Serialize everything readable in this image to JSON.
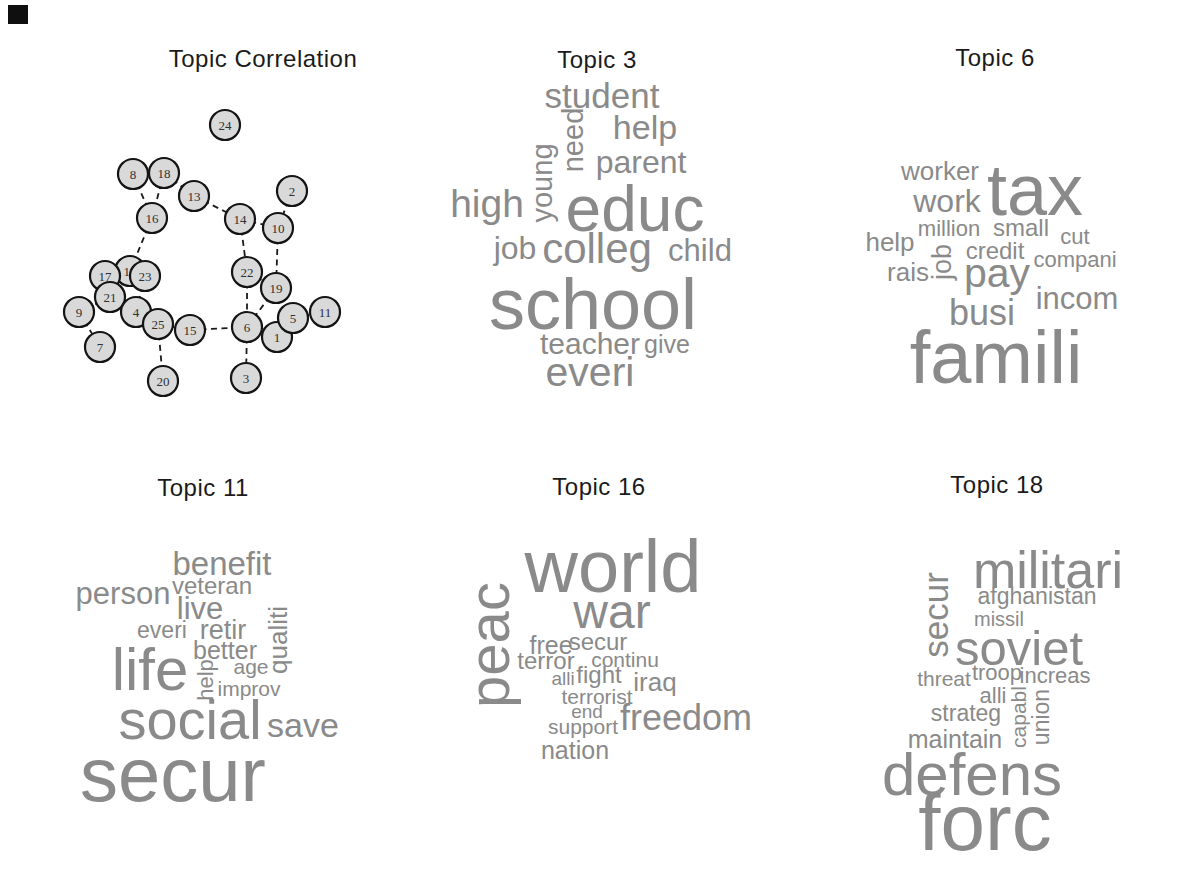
{
  "colors": {
    "background": "#ffffff",
    "word": "#8a8a8a",
    "title": "#1b1b1b",
    "node_fill": "#d9d9d9",
    "node_stroke": "#141414",
    "node_label": "#303030",
    "edge": "#1a1a1a",
    "corner_mark": "#0f0f0f"
  },
  "artifact": {
    "corner_mark_visible": true
  },
  "chart_data": [
    {
      "type": "scatter",
      "subtype": "network-graph",
      "title": "Topic Correlation",
      "title_x": 263,
      "title_y": 59,
      "legend_position": "none",
      "grid": false,
      "nodes": [
        {
          "id": "24",
          "x": 225,
          "y": 125
        },
        {
          "id": "8",
          "x": 133,
          "y": 174
        },
        {
          "id": "18",
          "x": 164,
          "y": 173
        },
        {
          "id": "13",
          "x": 194,
          "y": 196
        },
        {
          "id": "2",
          "x": 292,
          "y": 191
        },
        {
          "id": "16",
          "x": 152,
          "y": 218
        },
        {
          "id": "14",
          "x": 240,
          "y": 219
        },
        {
          "id": "10",
          "x": 278,
          "y": 228
        },
        {
          "id": "9",
          "x": 79,
          "y": 312
        },
        {
          "id": "12",
          "x": 130,
          "y": 271
        },
        {
          "id": "17",
          "x": 105,
          "y": 276
        },
        {
          "id": "23",
          "x": 145,
          "y": 276
        },
        {
          "id": "21",
          "x": 110,
          "y": 297
        },
        {
          "id": "4",
          "x": 136,
          "y": 312
        },
        {
          "id": "7",
          "x": 100,
          "y": 347
        },
        {
          "id": "15",
          "x": 190,
          "y": 330
        },
        {
          "id": "25",
          "x": 158,
          "y": 324
        },
        {
          "id": "20",
          "x": 163,
          "y": 381
        },
        {
          "id": "22",
          "x": 247,
          "y": 272
        },
        {
          "id": "19",
          "x": 276,
          "y": 288
        },
        {
          "id": "1",
          "x": 277,
          "y": 337
        },
        {
          "id": "6",
          "x": 247,
          "y": 327
        },
        {
          "id": "5",
          "x": 293,
          "y": 318
        },
        {
          "id": "11",
          "x": 325,
          "y": 312
        },
        {
          "id": "3",
          "x": 246,
          "y": 378
        }
      ],
      "edges": [
        [
          "8",
          "16"
        ],
        [
          "18",
          "16"
        ],
        [
          "8",
          "18"
        ],
        [
          "18",
          "13"
        ],
        [
          "13",
          "14"
        ],
        [
          "14",
          "10"
        ],
        [
          "2",
          "10"
        ],
        [
          "14",
          "22"
        ],
        [
          "10",
          "19"
        ],
        [
          "22",
          "19"
        ],
        [
          "22",
          "6"
        ],
        [
          "19",
          "6"
        ],
        [
          "15",
          "6"
        ],
        [
          "6",
          "3"
        ],
        [
          "6",
          "1"
        ],
        [
          "5",
          "1"
        ],
        [
          "5",
          "11"
        ],
        [
          "16",
          "12"
        ],
        [
          "12",
          "23"
        ],
        [
          "12",
          "17"
        ],
        [
          "17",
          "21"
        ],
        [
          "21",
          "9"
        ],
        [
          "9",
          "7"
        ],
        [
          "21",
          "4"
        ],
        [
          "4",
          "23"
        ],
        [
          "4",
          "25"
        ],
        [
          "25",
          "15"
        ],
        [
          "25",
          "20"
        ]
      ]
    },
    {
      "type": "scatter",
      "subtype": "wordcloud",
      "title": "Topic 3",
      "title_x": 597,
      "title_y": 60,
      "words": [
        {
          "t": "student",
          "x": 602,
          "y": 95,
          "s": 35,
          "r": 0
        },
        {
          "t": "need",
          "x": 573,
          "y": 140,
          "s": 29,
          "r": 90
        },
        {
          "t": "help",
          "x": 645,
          "y": 127,
          "s": 34,
          "r": 0
        },
        {
          "t": "young",
          "x": 542,
          "y": 183,
          "s": 29,
          "r": 90
        },
        {
          "t": "parent",
          "x": 641,
          "y": 162,
          "s": 32,
          "r": 0
        },
        {
          "t": "high",
          "x": 487,
          "y": 203,
          "s": 39,
          "r": 0
        },
        {
          "t": "educ",
          "x": 635,
          "y": 209,
          "s": 64,
          "r": 0
        },
        {
          "t": "job",
          "x": 515,
          "y": 248,
          "s": 32,
          "r": 0
        },
        {
          "t": "colleg",
          "x": 597,
          "y": 249,
          "s": 42,
          "r": 0
        },
        {
          "t": "child",
          "x": 700,
          "y": 250,
          "s": 31,
          "r": 0
        },
        {
          "t": "school",
          "x": 593,
          "y": 304,
          "s": 72,
          "r": 0
        },
        {
          "t": "teacher",
          "x": 590,
          "y": 344,
          "s": 30,
          "r": 0
        },
        {
          "t": "give",
          "x": 667,
          "y": 344,
          "s": 25,
          "r": 0
        },
        {
          "t": "everi",
          "x": 590,
          "y": 372,
          "s": 41,
          "r": 0
        }
      ]
    },
    {
      "type": "scatter",
      "subtype": "wordcloud",
      "title": "Topic 6",
      "title_x": 995,
      "title_y": 58,
      "words": [
        {
          "t": "worker",
          "x": 940,
          "y": 171,
          "s": 26,
          "r": 0
        },
        {
          "t": "tax",
          "x": 1035,
          "y": 190,
          "s": 72,
          "r": 0
        },
        {
          "t": "work",
          "x": 947,
          "y": 201,
          "s": 32,
          "r": 0
        },
        {
          "t": "million",
          "x": 949,
          "y": 229,
          "s": 22,
          "r": 0
        },
        {
          "t": "small",
          "x": 1021,
          "y": 228,
          "s": 24,
          "r": 0
        },
        {
          "t": "cut",
          "x": 1075,
          "y": 237,
          "s": 22,
          "r": 0
        },
        {
          "t": "help",
          "x": 890,
          "y": 242,
          "s": 26,
          "r": 0
        },
        {
          "t": "credit",
          "x": 995,
          "y": 251,
          "s": 24,
          "r": 0
        },
        {
          "t": "job",
          "x": 942,
          "y": 262,
          "s": 27,
          "r": 90
        },
        {
          "t": "compani",
          "x": 1075,
          "y": 260,
          "s": 22,
          "r": 0
        },
        {
          "t": "rais",
          "x": 908,
          "y": 272,
          "s": 26,
          "r": 0
        },
        {
          "t": "pay",
          "x": 997,
          "y": 273,
          "s": 41,
          "r": 0
        },
        {
          "t": "incom",
          "x": 1077,
          "y": 298,
          "s": 31,
          "r": 0
        },
        {
          "t": "busi",
          "x": 982,
          "y": 313,
          "s": 36,
          "r": 0
        },
        {
          "t": "famili",
          "x": 996,
          "y": 358,
          "s": 74,
          "r": 0
        }
      ]
    },
    {
      "type": "scatter",
      "subtype": "wordcloud",
      "title": "Topic 11",
      "title_x": 203,
      "title_y": 488,
      "words": [
        {
          "t": "benefit",
          "x": 222,
          "y": 563,
          "s": 33,
          "r": 0
        },
        {
          "t": "person",
          "x": 123,
          "y": 593,
          "s": 31,
          "r": 0
        },
        {
          "t": "veteran",
          "x": 212,
          "y": 586,
          "s": 24,
          "r": 0
        },
        {
          "t": "live",
          "x": 200,
          "y": 608,
          "s": 31,
          "r": 0
        },
        {
          "t": "everi",
          "x": 162,
          "y": 630,
          "s": 23,
          "r": 0
        },
        {
          "t": "retir",
          "x": 223,
          "y": 630,
          "s": 27,
          "r": 0
        },
        {
          "t": "qualiti",
          "x": 278,
          "y": 640,
          "s": 26,
          "r": 90
        },
        {
          "t": "better",
          "x": 225,
          "y": 650,
          "s": 25,
          "r": 0
        },
        {
          "t": "age",
          "x": 251,
          "y": 666,
          "s": 21,
          "r": 0
        },
        {
          "t": "life",
          "x": 150,
          "y": 670,
          "s": 60,
          "r": 0
        },
        {
          "t": "help",
          "x": 206,
          "y": 680,
          "s": 22,
          "r": 90
        },
        {
          "t": "improv",
          "x": 249,
          "y": 688,
          "s": 21,
          "r": 0
        },
        {
          "t": "social",
          "x": 190,
          "y": 720,
          "s": 56,
          "r": 0
        },
        {
          "t": "save",
          "x": 303,
          "y": 725,
          "s": 34,
          "r": 0
        },
        {
          "t": "secur",
          "x": 173,
          "y": 775,
          "s": 76,
          "r": 0
        }
      ]
    },
    {
      "type": "scatter",
      "subtype": "wordcloud",
      "title": "Topic 16",
      "title_x": 599,
      "title_y": 487,
      "words": [
        {
          "t": "world",
          "x": 613,
          "y": 567,
          "s": 74,
          "r": 0
        },
        {
          "t": "peac",
          "x": 489,
          "y": 645,
          "s": 58,
          "r": 90
        },
        {
          "t": "war",
          "x": 612,
          "y": 612,
          "s": 48,
          "r": 0
        },
        {
          "t": "free",
          "x": 551,
          "y": 645,
          "s": 25,
          "r": 0
        },
        {
          "t": "secur",
          "x": 598,
          "y": 642,
          "s": 24,
          "r": 0
        },
        {
          "t": "terror",
          "x": 546,
          "y": 661,
          "s": 24,
          "r": 0
        },
        {
          "t": "continu",
          "x": 625,
          "y": 659,
          "s": 21,
          "r": 0
        },
        {
          "t": "alli",
          "x": 563,
          "y": 678,
          "s": 19,
          "r": 0
        },
        {
          "t": "fight",
          "x": 599,
          "y": 675,
          "s": 24,
          "r": 0
        },
        {
          "t": "iraq",
          "x": 655,
          "y": 682,
          "s": 26,
          "r": 0
        },
        {
          "t": "terrorist",
          "x": 597,
          "y": 696,
          "s": 21,
          "r": 0
        },
        {
          "t": "end",
          "x": 587,
          "y": 711,
          "s": 19,
          "r": 0
        },
        {
          "t": "freedom",
          "x": 686,
          "y": 718,
          "s": 36,
          "r": 0
        },
        {
          "t": "support",
          "x": 583,
          "y": 726,
          "s": 21,
          "r": 0
        },
        {
          "t": "nation",
          "x": 575,
          "y": 750,
          "s": 25,
          "r": 0
        }
      ]
    },
    {
      "type": "scatter",
      "subtype": "wordcloud",
      "title": "Topic 18",
      "title_x": 997,
      "title_y": 485,
      "words": [
        {
          "t": "militari",
          "x": 1048,
          "y": 570,
          "s": 52,
          "r": 0
        },
        {
          "t": "secur",
          "x": 935,
          "y": 615,
          "s": 35,
          "r": 90
        },
        {
          "t": "afghanistan",
          "x": 1037,
          "y": 596,
          "s": 23,
          "r": 0
        },
        {
          "t": "missil",
          "x": 999,
          "y": 619,
          "s": 20,
          "r": 0
        },
        {
          "t": "soviet",
          "x": 1019,
          "y": 648,
          "s": 49,
          "r": 0
        },
        {
          "t": "threat",
          "x": 944,
          "y": 678,
          "s": 21,
          "r": 0
        },
        {
          "t": "troop",
          "x": 997,
          "y": 673,
          "s": 22,
          "r": 0
        },
        {
          "t": "increas",
          "x": 1055,
          "y": 676,
          "s": 22,
          "r": 0
        },
        {
          "t": "alli",
          "x": 993,
          "y": 696,
          "s": 22,
          "r": 0
        },
        {
          "t": "capabl",
          "x": 1018,
          "y": 717,
          "s": 21,
          "r": 90
        },
        {
          "t": "union",
          "x": 1041,
          "y": 717,
          "s": 23,
          "r": 90
        },
        {
          "t": "strateg",
          "x": 966,
          "y": 713,
          "s": 23,
          "r": 0
        },
        {
          "t": "maintain",
          "x": 955,
          "y": 739,
          "s": 25,
          "r": 0
        },
        {
          "t": "defens",
          "x": 972,
          "y": 775,
          "s": 60,
          "r": 0
        },
        {
          "t": "forc",
          "x": 985,
          "y": 823,
          "s": 80,
          "r": 0
        }
      ]
    }
  ]
}
